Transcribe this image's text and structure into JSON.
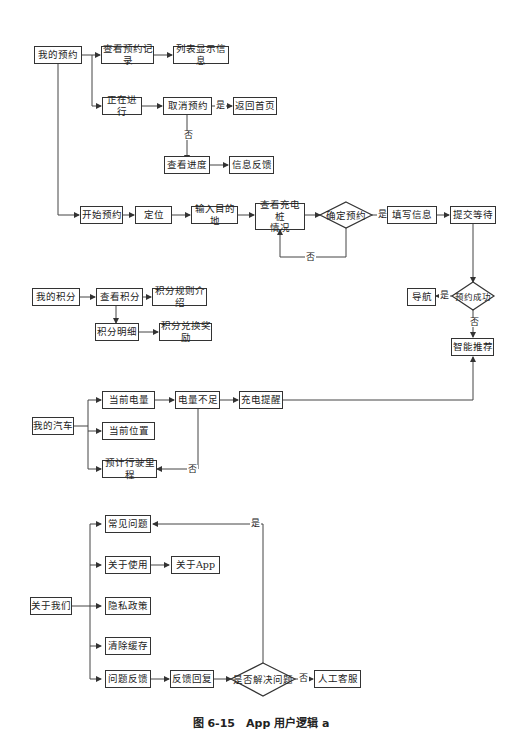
{
  "caption": "图 6-15　App 用户逻辑 a",
  "nodes": {
    "my_booking": "我的预约",
    "view_records": "查看预约记录",
    "list_info": "列表显示信息",
    "in_progress": "正在进行",
    "cancel_booking": "取消预约",
    "return_home": "返回首页",
    "view_progress": "查看进度",
    "info_feedback": "信息反馈",
    "start_booking": "开始预约",
    "locate": "定位",
    "input_destination": "输入目的地",
    "view_charger_line1": "查看充电桩",
    "view_charger_line2": "情况",
    "confirm_booking": "确定预约",
    "fill_info": "填写信息",
    "submit_wait": "提交等待",
    "navigate": "导航",
    "booking_success": "预约成功",
    "smart_recommend": "智能推荐",
    "my_points": "我的积分",
    "view_points": "查看积分",
    "points_rules": "积分规则介绍",
    "points_detail": "积分明细",
    "points_redeem": "积分兑换奖励",
    "my_car": "我的汽车",
    "current_battery": "当前电量",
    "low_battery": "电量不足",
    "charge_reminder": "充电提醒",
    "current_location": "当前位置",
    "estimated_range": "预计行驶里程",
    "about_us": "关于我们",
    "faq": "常见问题",
    "about_usage": "关于使用",
    "about_app": "关于App",
    "privacy_policy": "隐私政策",
    "clear_cache": "清除缓存",
    "feedback": "问题反馈",
    "feedback_reply": "反馈回复",
    "problem_solved": "是否解决问题",
    "human_service": "人工客服"
  },
  "edge_labels": {
    "yes": "是",
    "no": "否"
  }
}
